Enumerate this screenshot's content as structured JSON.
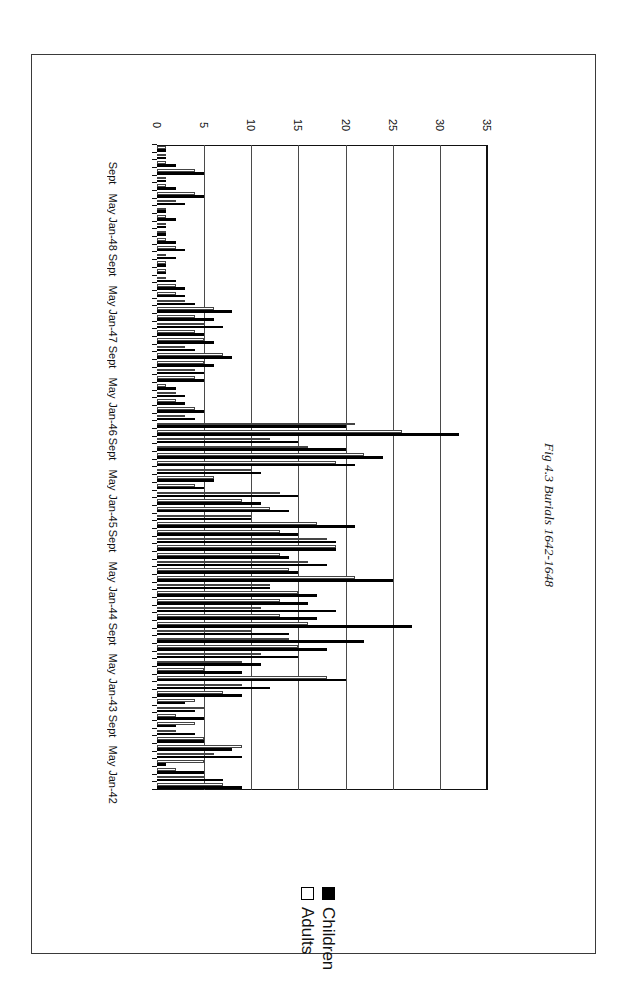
{
  "figure": {
    "title": "Fig 4.3 Burials 1642-1648"
  },
  "legend": {
    "position": "upper-center",
    "entries": [
      {
        "label": "Children",
        "swatch": "filled-black-square",
        "color": "#000000"
      },
      {
        "label": "Adults",
        "swatch": "open-white-square",
        "color": "#ffffff"
      }
    ]
  },
  "value_axis": {
    "ticks": [
      "0",
      "5",
      "10",
      "15",
      "20",
      "25",
      "30",
      "35"
    ],
    "min": 0,
    "max": 35,
    "step": 5
  },
  "category_axis": {
    "visible_labels": [
      "Jan-42",
      "May",
      "Sept",
      "Jan-43",
      "May",
      "Sept",
      "Jan-44",
      "May",
      "Sept",
      "Jan-45",
      "May",
      "Sept",
      "Jan-46",
      "May",
      "Sept",
      "Jan-47",
      "May",
      "Sept",
      "Jan-48",
      "May",
      "Sept"
    ]
  },
  "chart_data": {
    "type": "bar",
    "orientation": "horizontal-rotated-180",
    "title": "Fig 4.3 Burials 1642-1648",
    "xlabel": "",
    "ylabel": "",
    "xlim": [
      0,
      35
    ],
    "grid": true,
    "legend_position": "upper-center",
    "categories": [
      "Jan-42",
      "Feb-42",
      "Mar-42",
      "Apr-42",
      "May-42",
      "Jun-42",
      "Jul-42",
      "Aug-42",
      "Sept-42",
      "Oct-42",
      "Nov-42",
      "Dec-42",
      "Jan-43",
      "Feb-43",
      "Mar-43",
      "Apr-43",
      "May-43",
      "Jun-43",
      "Jul-43",
      "Aug-43",
      "Sept-43",
      "Oct-43",
      "Nov-43",
      "Dec-43",
      "Jan-44",
      "Feb-44",
      "Mar-44",
      "Apr-44",
      "May-44",
      "Jun-44",
      "Jul-44",
      "Aug-44",
      "Sept-44",
      "Oct-44",
      "Nov-44",
      "Dec-44",
      "Jan-45",
      "Feb-45",
      "Mar-45",
      "Apr-45",
      "May-45",
      "Jun-45",
      "Jul-45",
      "Aug-45",
      "Sept-45",
      "Oct-45",
      "Nov-45",
      "Dec-45",
      "Jan-46",
      "Feb-46",
      "Mar-46",
      "Apr-46",
      "May-46",
      "Jun-46",
      "Jul-46",
      "Aug-46",
      "Sept-46",
      "Oct-46",
      "Nov-46",
      "Dec-46",
      "Jan-47",
      "Feb-47",
      "Mar-47",
      "Apr-47",
      "May-47",
      "Jun-47",
      "Jul-47",
      "Aug-47",
      "Sept-47",
      "Oct-47",
      "Nov-47",
      "Dec-47",
      "Jan-48",
      "Feb-48",
      "Mar-48",
      "Apr-48",
      "May-48",
      "Jun-48",
      "Jul-48",
      "Aug-48",
      "Sept-48",
      "Oct-48",
      "Nov-48",
      "Dec-48"
    ],
    "series": [
      {
        "name": "Children",
        "color": "#000000",
        "values": [
          9,
          7,
          5,
          1,
          9,
          8,
          5,
          4,
          2,
          5,
          4,
          3,
          9,
          12,
          20,
          9,
          11,
          15,
          18,
          22,
          14,
          27,
          17,
          19,
          16,
          17,
          12,
          25,
          15,
          18,
          14,
          19,
          19,
          15,
          21,
          10,
          14,
          11,
          15,
          5,
          6,
          11,
          21,
          24,
          20,
          15,
          32,
          20,
          4,
          5,
          3,
          3,
          2,
          5,
          5,
          6,
          8,
          4,
          6,
          5,
          7,
          6,
          8,
          4,
          3,
          3,
          2,
          1,
          1,
          2,
          3,
          2,
          1,
          1,
          2,
          1,
          3,
          5,
          2,
          1,
          5,
          2,
          1,
          1
        ]
      },
      {
        "name": "Adults",
        "color": "#ffffff",
        "values": [
          7,
          5,
          2,
          5,
          6,
          9,
          5,
          2,
          4,
          2,
          5,
          4,
          7,
          9,
          18,
          5,
          9,
          11,
          15,
          14,
          10,
          16,
          13,
          11,
          13,
          15,
          12,
          21,
          14,
          16,
          13,
          19,
          18,
          13,
          17,
          10,
          12,
          9,
          13,
          4,
          6,
          10,
          19,
          22,
          16,
          12,
          26,
          21,
          3,
          4,
          2,
          2,
          1,
          4,
          4,
          5,
          7,
          3,
          5,
          4,
          5,
          4,
          6,
          3,
          2,
          2,
          1,
          1,
          1,
          1,
          2,
          1,
          1,
          1,
          1,
          1,
          2,
          4,
          1,
          1,
          4,
          1,
          1,
          1
        ]
      }
    ]
  }
}
